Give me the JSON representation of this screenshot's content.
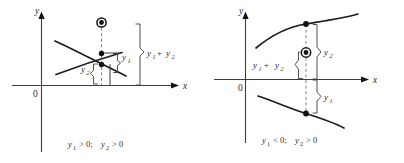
{
  "figure": {
    "background_color": "#ffffff",
    "ink_color": "#1a1a1a",
    "axis_color": "#3d3d3d",
    "dashed_color": "#6e6e6e"
  },
  "panels": [
    {
      "id": "left",
      "case_label": "both ordinates positive",
      "axes": {
        "y_label": "y",
        "x_label": "x",
        "origin_label": "0"
      },
      "curves": [
        {
          "name": "curve-y1-rising",
          "direction": "rising"
        },
        {
          "name": "curve-y2-falling",
          "direction": "falling"
        }
      ],
      "points": [
        {
          "name": "point-y1",
          "style": "filled-dot"
        },
        {
          "name": "point-y2",
          "style": "filled-dot"
        },
        {
          "name": "point-sum",
          "style": "circled-dot"
        }
      ],
      "measure_labels": {
        "y1": "y",
        "y1_sub": "1",
        "y2": "y",
        "y2_sub": "2",
        "sum_first": "y",
        "sum_first_sub": "1",
        "sum_operator": "+",
        "sum_second": "y",
        "sum_second_sub": "2"
      },
      "caption": {
        "var1": "y",
        "var1_sub": "1",
        "rel1": "> 0;",
        "var2": "y",
        "var2_sub": "2",
        "rel2": "> 0"
      }
    },
    {
      "id": "right",
      "case_label": "first ordinate negative, second positive",
      "axes": {
        "y_label": "y",
        "x_label": "x",
        "origin_label": "0"
      },
      "curves": [
        {
          "name": "curve-y2-upper",
          "direction": "rising-concave-down"
        },
        {
          "name": "curve-y1-lower",
          "direction": "falling-below-axis"
        }
      ],
      "points": [
        {
          "name": "point-y2",
          "style": "filled-dot"
        },
        {
          "name": "point-y1",
          "style": "filled-dot"
        },
        {
          "name": "point-sum",
          "style": "circled-dot"
        }
      ],
      "measure_labels": {
        "y1": "y",
        "y1_sub": "1",
        "y2": "y",
        "y2_sub": "2",
        "sum_first": "y",
        "sum_first_sub": "1",
        "sum_operator": "+",
        "sum_second": "y",
        "sum_second_sub": "2"
      },
      "caption": {
        "var1": "y",
        "var1_sub": "1",
        "rel1": "< 0;",
        "var2": "y",
        "var2_sub": "2",
        "rel2": "> 0"
      }
    }
  ]
}
